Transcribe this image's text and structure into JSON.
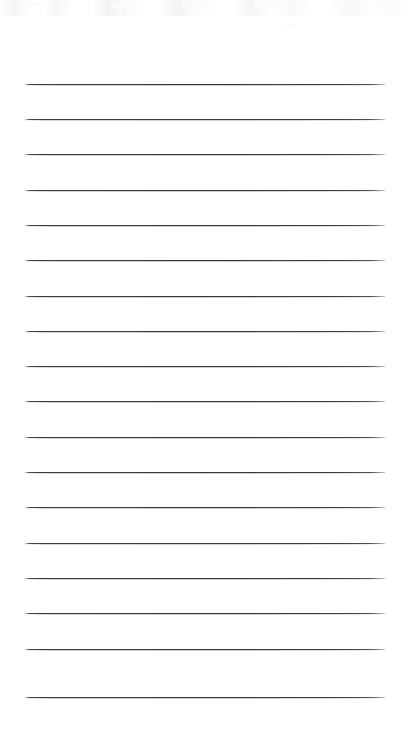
{
  "document": {
    "kind": "scanned-blank-ruled-page",
    "title": "Scanned Ruled Notepad Page",
    "page_width": 409,
    "page_height": 738,
    "background_color": "#ffffff",
    "written_text": "",
    "header_text": "",
    "footer_text": "",
    "page_number_text": ""
  },
  "ruling": {
    "line_color": "#3a3a3c",
    "line_thickness_px": 1.3,
    "line_count": 18,
    "line_left_px": 25,
    "line_right_px": 385,
    "line_width_px": 360,
    "first_line_y_px": 84,
    "last_line_y_px": 697,
    "line_pitch_px": 35.5,
    "top_margin_px": 84,
    "bottom_margin_px": 41,
    "left_margin_px": 25,
    "right_margin_px": 24,
    "line_y_positions": [
      84,
      119,
      154,
      190,
      225,
      260,
      296,
      331,
      366,
      401,
      437,
      472,
      507,
      543,
      578,
      613,
      649,
      697
    ]
  },
  "artifacts": {
    "scan_noise_color": "#fbfbfc",
    "top_noise_band_height_px": 16,
    "speck_positions": [
      {
        "x": 28,
        "y": 2,
        "w": 14,
        "h": 5
      },
      {
        "x": 62,
        "y": 1,
        "w": 9,
        "h": 4
      },
      {
        "x": 112,
        "y": 3,
        "w": 18,
        "h": 6
      },
      {
        "x": 118,
        "y": 9,
        "w": 3,
        "h": 6
      },
      {
        "x": 182,
        "y": 2,
        "w": 26,
        "h": 6
      },
      {
        "x": 254,
        "y": 2,
        "w": 22,
        "h": 7
      },
      {
        "x": 292,
        "y": 3,
        "w": 16,
        "h": 5
      },
      {
        "x": 332,
        "y": 2,
        "w": 11,
        "h": 5
      },
      {
        "x": 372,
        "y": 3,
        "w": 14,
        "h": 5
      },
      {
        "x": 286,
        "y": 24,
        "w": 8,
        "h": 4
      }
    ]
  }
}
